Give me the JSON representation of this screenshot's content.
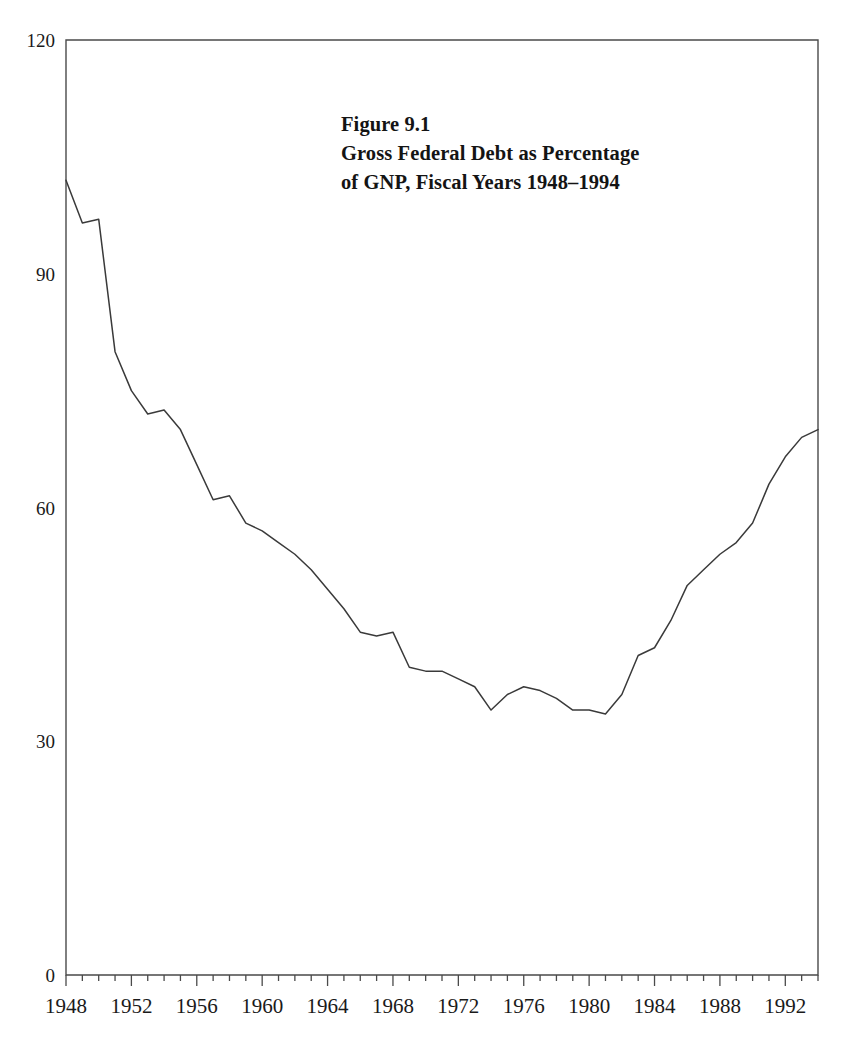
{
  "figure": {
    "label": "Figure 9.1",
    "title_line_1": "Gross Federal Debt as Percentage",
    "title_line_2": "of GNP, Fiscal Years 1948–1994"
  },
  "axes": {
    "y_tick_labels": [
      "120",
      "90",
      "60",
      "30",
      "0"
    ],
    "x_tick_labels": [
      "1948",
      "1952",
      "1956",
      "1960",
      "1964",
      "1968",
      "1972",
      "1976",
      "1980",
      "1984",
      "1988",
      "1992"
    ]
  },
  "colors": {
    "line": "#3a3a3a",
    "axis": "#4a4a4a",
    "text": "#1a1a1a",
    "background": "#ffffff"
  },
  "chart_data": {
    "type": "line",
    "title": "Figure 9.1 Gross Federal Debt as Percentage of GNP, Fiscal Years 1948–1994",
    "xlabel": "",
    "ylabel": "",
    "xlim": [
      1948,
      1994
    ],
    "ylim": [
      0,
      120
    ],
    "yticks": [
      0,
      30,
      60,
      90,
      120
    ],
    "xticks": [
      1948,
      1952,
      1956,
      1960,
      1964,
      1968,
      1972,
      1976,
      1980,
      1984,
      1988,
      1992
    ],
    "x_minor_tick_interval": 1,
    "grid": false,
    "legend": null,
    "series": [
      {
        "name": "Gross Federal Debt as Percentage of GNP",
        "x": [
          1948,
          1949,
          1950,
          1951,
          1952,
          1953,
          1954,
          1955,
          1956,
          1957,
          1958,
          1959,
          1960,
          1961,
          1962,
          1963,
          1964,
          1965,
          1966,
          1967,
          1968,
          1969,
          1970,
          1971,
          1972,
          1973,
          1974,
          1975,
          1976,
          1977,
          1978,
          1979,
          1980,
          1981,
          1982,
          1983,
          1984,
          1985,
          1986,
          1987,
          1988,
          1989,
          1990,
          1991,
          1992,
          1993,
          1994
        ],
        "values": [
          102.0,
          96.5,
          97.0,
          80.0,
          75.0,
          72.0,
          72.5,
          70.0,
          65.5,
          61.0,
          61.5,
          58.0,
          57.0,
          55.5,
          54.0,
          52.0,
          49.5,
          47.0,
          44.0,
          43.5,
          44.0,
          39.5,
          39.0,
          39.0,
          38.0,
          37.0,
          34.0,
          36.0,
          37.0,
          36.5,
          35.5,
          34.0,
          34.0,
          33.5,
          36.0,
          41.0,
          42.0,
          45.5,
          50.0,
          52.0,
          54.0,
          55.5,
          58.0,
          63.0,
          66.5,
          69.0,
          70.0
        ]
      }
    ]
  }
}
